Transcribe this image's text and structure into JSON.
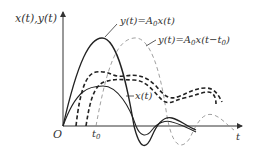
{
  "diagram": {
    "y_axis_label": "x(t),y(t)",
    "x_axis_label": "t",
    "origin_label": "O",
    "t0_label": "t",
    "t0_sub": "0",
    "annotations": {
      "y_amplified": "y(t)=A",
      "y_amplified_sub": "0",
      "y_amplified_rest": "x(t)",
      "y_delayed": "y(t)=A",
      "y_delayed_sub": "0",
      "y_delayed_rest": "x(t−t",
      "y_delayed_sub2": "0",
      "y_delayed_end": ")",
      "x_signal": "x(t)"
    },
    "colors": {
      "axis": "#333333",
      "solid_curve": "#222222",
      "dashed_curve": "#222222",
      "thin_dashed_curve": "#888888"
    }
  }
}
